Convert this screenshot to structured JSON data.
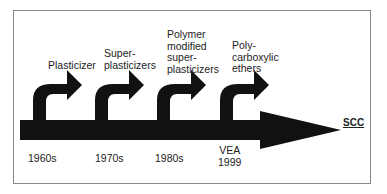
{
  "diagram": {
    "stages": [
      {
        "label": "Plasticizer",
        "year": "1960s"
      },
      {
        "label": "Super-\nplasticizers",
        "year": "1970s"
      },
      {
        "label": "Polymer\nmodified\nsuper-\nplasticizers",
        "year": "1980s"
      },
      {
        "label": "Poly-\ncarboxylic\nethers",
        "year": "VEA\n1999"
      }
    ],
    "endpoint": "SCC",
    "colors": {
      "arrow": "#111111",
      "frame": "#8a8a8a",
      "background": "#ffffff"
    }
  }
}
